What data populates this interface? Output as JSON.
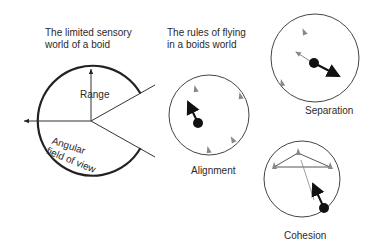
{
  "diagram": {
    "left_panel": {
      "title_line1": "The limited sensory",
      "title_line2": "world of a boid",
      "range_label": "Range",
      "fov_label_line1": "Angular",
      "fov_label_line2": "field of view"
    },
    "right_panel": {
      "title_line1": "The rules of flying",
      "title_line2": "in a boids world",
      "rules": [
        {
          "name": "Separation"
        },
        {
          "name": "Alignment"
        },
        {
          "name": "Cohesion"
        }
      ]
    },
    "colors": {
      "line": "#222222",
      "neighbor_boid": "#8a8a8a",
      "circle": "#444444"
    }
  }
}
